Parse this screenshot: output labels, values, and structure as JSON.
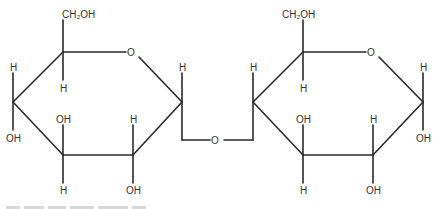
{
  "diagram": {
    "type": "structural-formula",
    "colors": {
      "bond": "#2a2a2a",
      "label": "#333333",
      "background": "#ffffff"
    },
    "left_ring": {
      "ch2oh": "CH₂OH",
      "ring_oxygen": "O",
      "c5_h": "H",
      "c1_h": "H",
      "c4_h": "H",
      "c4_oh": "OH",
      "c3_oh": "OH",
      "c3_h": "H",
      "c2_h": "H",
      "c2_oh": "OH"
    },
    "bridge": {
      "oxygen": "O"
    },
    "right_ring": {
      "ch2oh": "CH₂OH",
      "ring_oxygen": "O",
      "c5_h": "H",
      "c4_h": "H",
      "c1_h": "H",
      "c1_oh": "OH",
      "c3_oh": "OH",
      "c3_h": "H",
      "c2_h": "H",
      "c2_oh": "OH"
    }
  }
}
